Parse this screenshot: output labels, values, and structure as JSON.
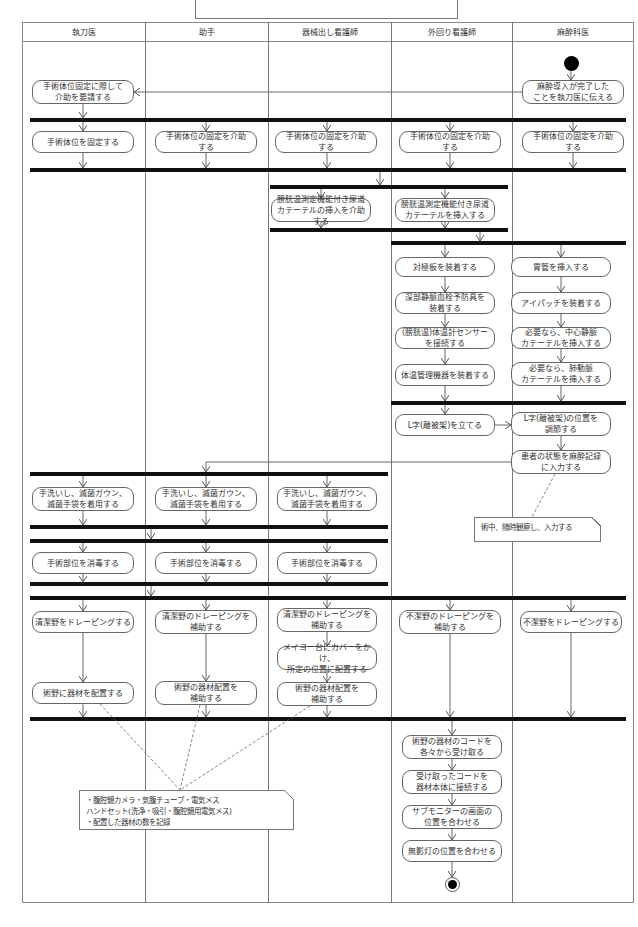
{
  "diagram": {
    "title": "",
    "lanes": [
      {
        "id": "surgeon",
        "label": "執刀医",
        "x": 22,
        "w": 123
      },
      {
        "id": "assistant",
        "label": "助手",
        "x": 145,
        "w": 123
      },
      {
        "id": "scrub_nurse",
        "label": "器械出し看護師",
        "x": 268,
        "w": 123
      },
      {
        "id": "circulating_nurse",
        "label": "外回り看護師",
        "x": 391,
        "w": 121
      },
      {
        "id": "anesthesiologist",
        "label": "麻酔科医",
        "x": 512,
        "w": 122
      }
    ],
    "bars": [
      {
        "x": 30,
        "y": 118,
        "w": 596
      },
      {
        "x": 30,
        "y": 168,
        "w": 596
      },
      {
        "x": 270,
        "y": 185,
        "w": 238
      },
      {
        "x": 270,
        "y": 228,
        "w": 238
      },
      {
        "x": 391,
        "y": 241,
        "w": 235
      },
      {
        "x": 391,
        "y": 401,
        "w": 235
      },
      {
        "x": 30,
        "y": 472,
        "w": 358
      },
      {
        "x": 30,
        "y": 525,
        "w": 358
      },
      {
        "x": 30,
        "y": 539,
        "w": 358
      },
      {
        "x": 30,
        "y": 582,
        "w": 358
      },
      {
        "x": 30,
        "y": 596,
        "w": 596
      },
      {
        "x": 30,
        "y": 717,
        "w": 596
      }
    ],
    "nodes": [
      {
        "id": "n1",
        "lane": "anesthesiologist",
        "x": 522,
        "y": 80,
        "w": 102,
        "h": 24,
        "text": "麻酔導入が完了した\nことを執刀医に伝える"
      },
      {
        "id": "n2",
        "lane": "surgeon",
        "x": 32,
        "y": 80,
        "w": 102,
        "h": 24,
        "text": "手術体位固定に際して\n介助を要請する"
      },
      {
        "id": "n3",
        "lane": "surgeon",
        "x": 32,
        "y": 131,
        "w": 102,
        "h": 22,
        "text": "手術体位を固定する"
      },
      {
        "id": "n4",
        "lane": "assistant",
        "x": 155,
        "y": 131,
        "w": 102,
        "h": 22,
        "text": "手術体位の固定を介助\nする"
      },
      {
        "id": "n5",
        "lane": "scrub_nurse",
        "x": 275,
        "y": 131,
        "w": 102,
        "h": 22,
        "text": "手術体位の固定を介助\nする"
      },
      {
        "id": "n6",
        "lane": "circulating_nurse",
        "x": 399,
        "y": 131,
        "w": 102,
        "h": 22,
        "text": "手術体位の固定を介助\nする"
      },
      {
        "id": "n7",
        "lane": "anesthesiologist",
        "x": 522,
        "y": 131,
        "w": 102,
        "h": 22,
        "text": "手術体位の固定を介助\nする"
      },
      {
        "id": "n8",
        "lane": "scrub_nurse",
        "x": 271,
        "y": 198,
        "w": 100,
        "h": 24,
        "text": "膀胱温測定機能付き尿道\nカテーテルの挿入を介助する"
      },
      {
        "id": "n9",
        "lane": "circulating_nurse",
        "x": 395,
        "y": 198,
        "w": 100,
        "h": 24,
        "text": "膀胱温測定機能付き尿道\nカテーテルを挿入する"
      },
      {
        "id": "n10",
        "lane": "circulating_nurse",
        "x": 395,
        "y": 257,
        "w": 100,
        "h": 20,
        "text": "対極板を装着する"
      },
      {
        "id": "n11",
        "lane": "circulating_nurse",
        "x": 395,
        "y": 292,
        "w": 100,
        "h": 22,
        "text": "深部静脈血栓予防具を\n装着する"
      },
      {
        "id": "n12",
        "lane": "circulating_nurse",
        "x": 395,
        "y": 327,
        "w": 100,
        "h": 22,
        "text": "(膀胱温)体温計センサー\nを接続する"
      },
      {
        "id": "n13",
        "lane": "circulating_nurse",
        "x": 395,
        "y": 364,
        "w": 100,
        "h": 22,
        "text": "体温管理機器を装着する"
      },
      {
        "id": "n14",
        "lane": "anesthesiologist",
        "x": 511,
        "y": 257,
        "w": 100,
        "h": 20,
        "text": "胃管を挿入する"
      },
      {
        "id": "n15",
        "lane": "anesthesiologist",
        "x": 511,
        "y": 292,
        "w": 100,
        "h": 22,
        "text": "アイパッチを装着する"
      },
      {
        "id": "n16",
        "lane": "anesthesiologist",
        "x": 511,
        "y": 327,
        "w": 100,
        "h": 22,
        "text": "必要なら、中心静脈\nカテーテルを挿入する"
      },
      {
        "id": "n17",
        "lane": "anesthesiologist",
        "x": 511,
        "y": 362,
        "w": 100,
        "h": 24,
        "text": "必要なら、肺動脈\nカテーテルを挿入する"
      },
      {
        "id": "n18",
        "lane": "circulating_nurse",
        "x": 395,
        "y": 414,
        "w": 100,
        "h": 22,
        "text": "L字(離被架)を立てる"
      },
      {
        "id": "n19",
        "lane": "anesthesiologist",
        "x": 511,
        "y": 412,
        "w": 100,
        "h": 24,
        "text": "L字(離被架)の位置を\n調節する"
      },
      {
        "id": "n20",
        "lane": "anesthesiologist",
        "x": 511,
        "y": 450,
        "w": 100,
        "h": 24,
        "text": "患者の状態を麻酔記録\nに入力する"
      },
      {
        "id": "n21",
        "lane": "surgeon",
        "x": 32,
        "y": 487,
        "w": 102,
        "h": 24,
        "text": "手洗いし、滅菌ガウン、\n滅菌手袋を着用する"
      },
      {
        "id": "n22",
        "lane": "assistant",
        "x": 155,
        "y": 487,
        "w": 102,
        "h": 24,
        "text": "手洗いし、滅菌ガウン、\n滅菌手袋を着用する"
      },
      {
        "id": "n23",
        "lane": "scrub_nurse",
        "x": 277,
        "y": 487,
        "w": 100,
        "h": 24,
        "text": "手洗いし、滅菌ガウン、\n滅菌手袋を着用する"
      },
      {
        "id": "n24",
        "lane": "surgeon",
        "x": 32,
        "y": 552,
        "w": 102,
        "h": 22,
        "text": "手術部位を消毒する"
      },
      {
        "id": "n25",
        "lane": "assistant",
        "x": 155,
        "y": 552,
        "w": 102,
        "h": 22,
        "text": "手術部位を消毒する"
      },
      {
        "id": "n26",
        "lane": "scrub_nurse",
        "x": 277,
        "y": 552,
        "w": 100,
        "h": 22,
        "text": "手術部位を消毒する"
      },
      {
        "id": "n27",
        "lane": "surgeon",
        "x": 32,
        "y": 611,
        "w": 102,
        "h": 22,
        "text": "清潔野をドレーピングする"
      },
      {
        "id": "n28",
        "lane": "assistant",
        "x": 155,
        "y": 610,
        "w": 102,
        "h": 24,
        "text": "清潔野のドレーピングを\n補助する"
      },
      {
        "id": "n29",
        "lane": "scrub_nurse",
        "x": 277,
        "y": 608,
        "w": 100,
        "h": 24,
        "text": "清潔野のドレーピングを\n補助する"
      },
      {
        "id": "n30",
        "lane": "circulating_nurse",
        "x": 399,
        "y": 610,
        "w": 102,
        "h": 24,
        "text": "不潔野のドレーピングを\n補助する"
      },
      {
        "id": "n31",
        "lane": "anesthesiologist",
        "x": 520,
        "y": 611,
        "w": 102,
        "h": 22,
        "text": "不潔野をドレーピングする"
      },
      {
        "id": "n32",
        "lane": "scrub_nurse",
        "x": 277,
        "y": 646,
        "w": 100,
        "h": 24,
        "text": "メイヨー台にカバーをかけ、\n所定の位置に配置する"
      },
      {
        "id": "n33",
        "lane": "surgeon",
        "x": 32,
        "y": 682,
        "w": 102,
        "h": 22,
        "text": "術野に器材を配置する"
      },
      {
        "id": "n34",
        "lane": "assistant",
        "x": 155,
        "y": 681,
        "w": 102,
        "h": 24,
        "text": "術野の器材配置を\n補助する"
      },
      {
        "id": "n35",
        "lane": "scrub_nurse",
        "x": 277,
        "y": 682,
        "w": 100,
        "h": 24,
        "text": "術野の器材配置を\n補助する"
      },
      {
        "id": "n36",
        "lane": "circulating_nurse",
        "x": 402,
        "y": 735,
        "w": 100,
        "h": 24,
        "text": "術野の器材のコードを\n各々から受け取る"
      },
      {
        "id": "n37",
        "lane": "circulating_nurse",
        "x": 402,
        "y": 770,
        "w": 100,
        "h": 24,
        "text": "受け取ったコードを\n器材本体に接続する"
      },
      {
        "id": "n38",
        "lane": "circulating_nurse",
        "x": 402,
        "y": 805,
        "w": 100,
        "h": 24,
        "text": "サブモニターの画面の\n位置を合わせる"
      },
      {
        "id": "n39",
        "lane": "circulating_nurse",
        "x": 402,
        "y": 840,
        "w": 100,
        "h": 22,
        "text": "無影灯の位置を合わせる"
      }
    ],
    "notes": [
      {
        "id": "note1",
        "x": 474,
        "y": 517,
        "w": 127,
        "h": 25,
        "text": "術中、随時観察し、入力する"
      },
      {
        "id": "note2",
        "x": 79,
        "y": 790,
        "w": 215,
        "h": 40,
        "text": "・腹腔鏡カメラ・気腹チューブ・電気メス\n ハンドセット(洗浄・吸引・腹腔鏡用電気メス)\n・配置した器材の数を記録"
      }
    ],
    "start": {
      "x": 564,
      "y": 56
    },
    "end": {
      "x": 445,
      "y": 877
    },
    "edges": [
      [
        571,
        71,
        571,
        80
      ],
      [
        522,
        92,
        134,
        92
      ],
      [
        83,
        104,
        83,
        118
      ],
      [
        83,
        122,
        83,
        131
      ],
      [
        206,
        122,
        206,
        131
      ],
      [
        327,
        122,
        327,
        131
      ],
      [
        450,
        122,
        450,
        131
      ],
      [
        573,
        122,
        573,
        131
      ],
      [
        83,
        153,
        83,
        168
      ],
      [
        206,
        153,
        206,
        168
      ],
      [
        327,
        153,
        327,
        168
      ],
      [
        450,
        153,
        450,
        168
      ],
      [
        573,
        153,
        573,
        168
      ],
      [
        380,
        172,
        380,
        185
      ],
      [
        321,
        189,
        321,
        198
      ],
      [
        445,
        189,
        445,
        198
      ],
      [
        321,
        222,
        321,
        228
      ],
      [
        445,
        222,
        445,
        228
      ],
      [
        480,
        232,
        480,
        241
      ],
      [
        445,
        245,
        445,
        257
      ],
      [
        561,
        245,
        561,
        257
      ],
      [
        445,
        277,
        445,
        292
      ],
      [
        445,
        314,
        445,
        327
      ],
      [
        445,
        349,
        445,
        364
      ],
      [
        445,
        386,
        445,
        401
      ],
      [
        561,
        277,
        561,
        292
      ],
      [
        561,
        314,
        561,
        327
      ],
      [
        561,
        349,
        561,
        362
      ],
      [
        561,
        386,
        561,
        401
      ],
      [
        445,
        405,
        445,
        414
      ],
      [
        495,
        425,
        511,
        425
      ],
      [
        561,
        436,
        561,
        450
      ],
      [
        511,
        462,
        206,
        462
      ],
      [
        206,
        462,
        206,
        472
      ],
      [
        83,
        476,
        83,
        487
      ],
      [
        206,
        476,
        206,
        487
      ],
      [
        327,
        476,
        327,
        487
      ],
      [
        83,
        511,
        83,
        525
      ],
      [
        206,
        511,
        206,
        525
      ],
      [
        327,
        511,
        327,
        525
      ],
      [
        151,
        529,
        151,
        539
      ],
      [
        83,
        543,
        83,
        552
      ],
      [
        206,
        543,
        206,
        552
      ],
      [
        327,
        543,
        327,
        552
      ],
      [
        83,
        574,
        83,
        582
      ],
      [
        206,
        574,
        206,
        582
      ],
      [
        327,
        574,
        327,
        582
      ],
      [
        151,
        586,
        151,
        596
      ],
      [
        83,
        600,
        83,
        611
      ],
      [
        206,
        600,
        206,
        610
      ],
      [
        327,
        600,
        327,
        608
      ],
      [
        450,
        600,
        450,
        610
      ],
      [
        571,
        600,
        571,
        611
      ],
      [
        83,
        633,
        83,
        682
      ],
      [
        206,
        634,
        206,
        681
      ],
      [
        327,
        632,
        327,
        646
      ],
      [
        327,
        670,
        327,
        682
      ],
      [
        83,
        704,
        83,
        717
      ],
      [
        206,
        705,
        206,
        717
      ],
      [
        327,
        706,
        327,
        717
      ],
      [
        450,
        634,
        450,
        717
      ],
      [
        571,
        633,
        571,
        717
      ],
      [
        452,
        721,
        452,
        735
      ],
      [
        452,
        759,
        452,
        770
      ],
      [
        452,
        794,
        452,
        805
      ],
      [
        452,
        829,
        452,
        840
      ],
      [
        452,
        862,
        452,
        877
      ]
    ],
    "dashed": [
      [
        555,
        474,
        532,
        517
      ],
      [
        100,
        704,
        180,
        790
      ],
      [
        200,
        705,
        180,
        790
      ],
      [
        310,
        706,
        180,
        790
      ]
    ]
  }
}
